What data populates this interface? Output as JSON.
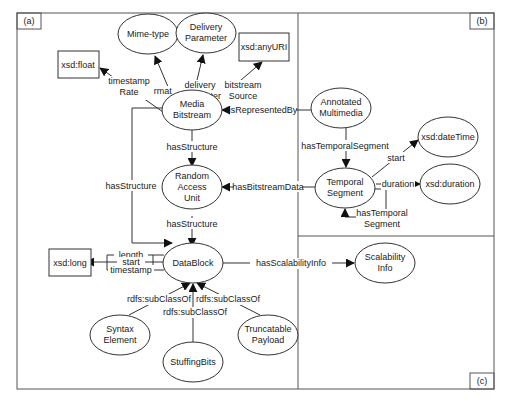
{
  "panels": {
    "a": "(a)",
    "b": "(b)",
    "c": "(c)"
  },
  "nodes": {
    "mime_type": "Mime-type",
    "delivery_parameter": [
      "Delivery",
      "Parameter"
    ],
    "xsd_anyuri": "xsd:anyURI",
    "xsd_float": "xsd:float",
    "media_bitstream": [
      "Media",
      "Bitstream"
    ],
    "annotated_multimedia": [
      "Annotated",
      "Multimedia"
    ],
    "random_access_unit": [
      "Random",
      "Access",
      "Unit"
    ],
    "temporal_segment": [
      "Temporal",
      "Segment"
    ],
    "xsd_datetime": "xsd:dateTime",
    "xsd_duration": "xsd:duration",
    "xsd_long": "xsd:long",
    "datablock": "DataBlock",
    "scalability_info": [
      "Scalability",
      "Info"
    ],
    "syntax_element": [
      "Syntax",
      "Element"
    ],
    "stuffing_bits": "StuffingBits",
    "truncatable_payload": [
      "Truncatable",
      "Payload"
    ]
  },
  "edges": {
    "format": "format",
    "delivery_parameter": [
      "delivery",
      "Parameter"
    ],
    "bitstream_source": [
      "bitstream",
      "Source"
    ],
    "timestamp_rate": [
      "timestamp",
      "Rate"
    ],
    "is_represented_by": "isRepresentedBy",
    "has_structure_1": "hasStructure",
    "has_structure_2": "hasStructure",
    "has_structure_3": "hasStructure",
    "has_temporal_segment": "hasTemporalSegment",
    "has_bitstream_data": "hasBitstreamData",
    "start_dt": "start",
    "duration": "duration",
    "has_temporal_segment_self": [
      "hasTemporal",
      "Segment"
    ],
    "length": "length",
    "start_long": "start",
    "timestamp": "timestamp",
    "has_scalability_info": "hasScalabilityInfo",
    "subclass_syntax": "rdfs:subClassOf",
    "subclass_stuffing": "rdfs:subClassOf",
    "subclass_truncatable": "rdfs:subClassOf"
  }
}
